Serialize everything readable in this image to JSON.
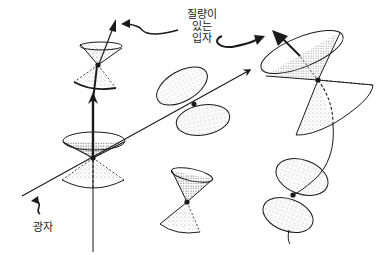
{
  "labels": {
    "massive_particle": [
      "질량이",
      "있는",
      "입자"
    ],
    "photon": "광자"
  },
  "colors": {
    "ink": "#1a1a1a",
    "background": "#ffffff",
    "stipple": "#555555"
  },
  "elements": {
    "photon_worldline": {
      "from": [
        22,
        195
      ],
      "to": [
        250,
        70
      ],
      "arrow": true
    },
    "massive_worldline_left": {
      "from": [
        93,
        252
      ],
      "to": [
        87,
        15
      ],
      "arrow": true
    },
    "massive_worldline_right": {
      "curved": true,
      "arrow": true
    },
    "light_cones": [
      {
        "id": "left-lower",
        "vertex": [
          93,
          158
        ],
        "tilt": "upright"
      },
      {
        "id": "left-upper",
        "vertex": [
          98,
          65
        ],
        "tilt": "upright"
      },
      {
        "id": "middle-top",
        "vertex": [
          194,
          104
        ],
        "tilt": "tilted-along-photon"
      },
      {
        "id": "middle-bottom",
        "vertex": [
          187,
          202
        ],
        "tilt": "slight"
      },
      {
        "id": "right-top",
        "vertex": [
          318,
          80
        ],
        "tilt": "strong"
      },
      {
        "id": "right-bottom",
        "vertex": [
          293,
          195
        ],
        "tilt": "strong"
      }
    ]
  }
}
